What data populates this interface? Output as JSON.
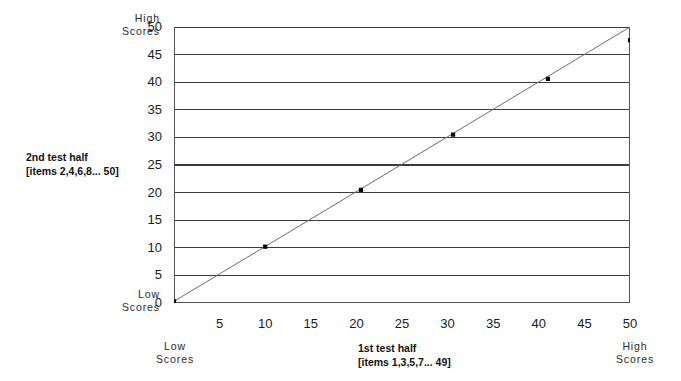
{
  "chart_data": {
    "type": "scatter",
    "title": "",
    "subtitle": "",
    "xlabel": "1st test half",
    "xlabel_sub": "[items 1,3,5,7... 49]",
    "ylabel": "2nd test half",
    "ylabel_sub": "[items 2,4,6,8... 50]",
    "xlim": [
      0,
      50
    ],
    "ylim": [
      0,
      50
    ],
    "xticks": [
      0,
      5,
      10,
      15,
      20,
      25,
      30,
      35,
      40,
      45,
      50
    ],
    "xtick_labels": [
      "",
      "5",
      "10",
      "15",
      "20",
      "25",
      "30",
      "35",
      "40",
      "45",
      "50"
    ],
    "yticks": [
      0,
      5,
      10,
      15,
      20,
      25,
      30,
      35,
      40,
      45,
      50
    ],
    "ytick_labels": [
      "0",
      "5",
      "10",
      "15",
      "20",
      "25",
      "30",
      "35",
      "40",
      "45",
      "50"
    ],
    "grid": "horizontal",
    "legend": "none",
    "marker_color": "#000000",
    "line_color": "#6e6e6e",
    "grid_color": "#3b3b3b",
    "axis_color": "#555555",
    "points": [
      {
        "x": 0.0,
        "y": 0.3
      },
      {
        "x": 10.0,
        "y": 10.2
      },
      {
        "x": 20.5,
        "y": 20.5
      },
      {
        "x": 30.6,
        "y": 30.5
      },
      {
        "x": 41.0,
        "y": 40.6
      },
      {
        "x": 50.0,
        "y": 47.6
      }
    ],
    "trend_line": {
      "from": {
        "x": 0.0,
        "y": 0.3
      },
      "to": {
        "x": 50.0,
        "y": 50.0
      }
    },
    "annotations": {
      "y_high": "High\nScores",
      "y_low": "Low\nScores",
      "x_low": "Low\nScores",
      "x_high": "High\nScores"
    }
  }
}
